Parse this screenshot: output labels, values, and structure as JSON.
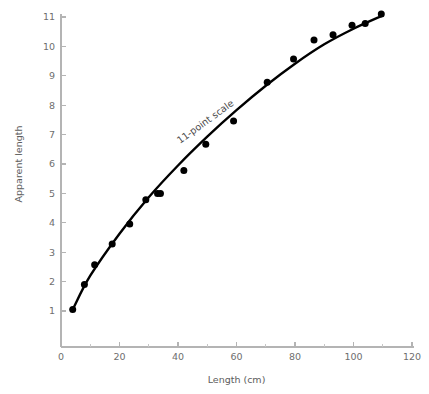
{
  "chart_data": {
    "type": "scatter",
    "title": "",
    "xlabel": "Length (cm)",
    "ylabel": "Apparent length",
    "xlim": [
      0,
      120
    ],
    "ylim": [
      0,
      11.6
    ],
    "grid": false,
    "legend": "none",
    "annotations": [
      {
        "text": "11-point scale",
        "x": 50,
        "y": 7.35,
        "rotation": -36
      }
    ],
    "xticks": [
      0,
      20,
      40,
      60,
      80,
      100,
      120
    ],
    "xtick_labels": [
      "0",
      "20",
      "40",
      "60",
      "80",
      "100",
      "120"
    ],
    "xminor_ticks": [
      10,
      30,
      50,
      70,
      90,
      110
    ],
    "yticks": [
      1,
      2,
      3,
      4,
      5,
      6,
      7,
      8,
      9,
      10,
      11
    ],
    "ytick_labels": [
      "1",
      "2",
      "3",
      "4",
      "5",
      "6",
      "7",
      "8",
      "9",
      "10",
      "11"
    ],
    "series": [
      {
        "name": "Observed judgments",
        "marker": "filled-circle",
        "color": "#000000",
        "x": [
          4,
          8,
          11.5,
          17.5,
          23.5,
          29,
          33,
          34,
          42,
          49.5,
          59,
          70.5,
          79.5,
          86.5,
          93,
          99.5,
          104,
          109.5
        ],
        "y": [
          1.05,
          1.9,
          2.57,
          3.28,
          3.96,
          4.78,
          5.0,
          5.0,
          5.78,
          6.67,
          7.46,
          8.78,
          9.57,
          10.22,
          10.4,
          10.72,
          10.78,
          11.1
        ]
      },
      {
        "name": "Fitted curve",
        "marker": "none",
        "color": "#000000",
        "x": [
          4,
          10,
          20,
          30,
          40,
          50,
          60,
          70,
          80,
          90,
          100,
          110
        ],
        "y": [
          1.05,
          2.2,
          3.63,
          4.87,
          5.95,
          6.93,
          7.83,
          8.66,
          9.41,
          10.07,
          10.6,
          11.05
        ]
      }
    ]
  }
}
